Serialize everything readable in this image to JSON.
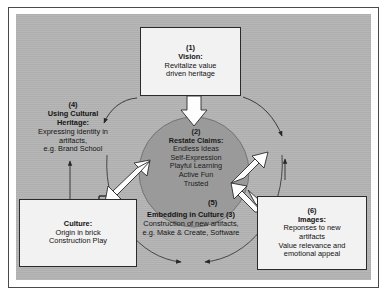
{
  "diagram": {
    "panel_color": "#b4b4b4",
    "circle_color": "#9a9a9a",
    "box_color": "#f2f2f2",
    "line_color": "#2b2b2b"
  },
  "vision": {
    "number": "(1)",
    "title": "Vision:",
    "line1": "Revitalize value",
    "line2": "driven heritage"
  },
  "claims": {
    "number": "(2)",
    "title": "Restate Claims:",
    "items": [
      "Endless Ideas",
      "Self-Expression",
      "Playful Learning",
      "Active Fun",
      "Trusted"
    ]
  },
  "embedding": {
    "title": "Embedding in Culture (3)",
    "line1": "Construction of new artifacts,",
    "line2": "e.g. Make & Create, Software"
  },
  "cultural_heritage": {
    "number": "(4)",
    "title_line1": "Using Cultural",
    "title_line2": "Heritage:",
    "line1": "Expressing identity in",
    "line2": "artifacts,",
    "line3": "e.g. Brand School"
  },
  "culture": {
    "title": "Culture:",
    "line1": "Origin in brick",
    "line2": "Construction Play"
  },
  "images": {
    "number": "(6)",
    "title": "Images:",
    "line1": "Reponses to new",
    "line2": "artifacts",
    "line3": "Value relevance and",
    "line4": "emotional appeal"
  },
  "tags": {
    "five": "(5)"
  }
}
